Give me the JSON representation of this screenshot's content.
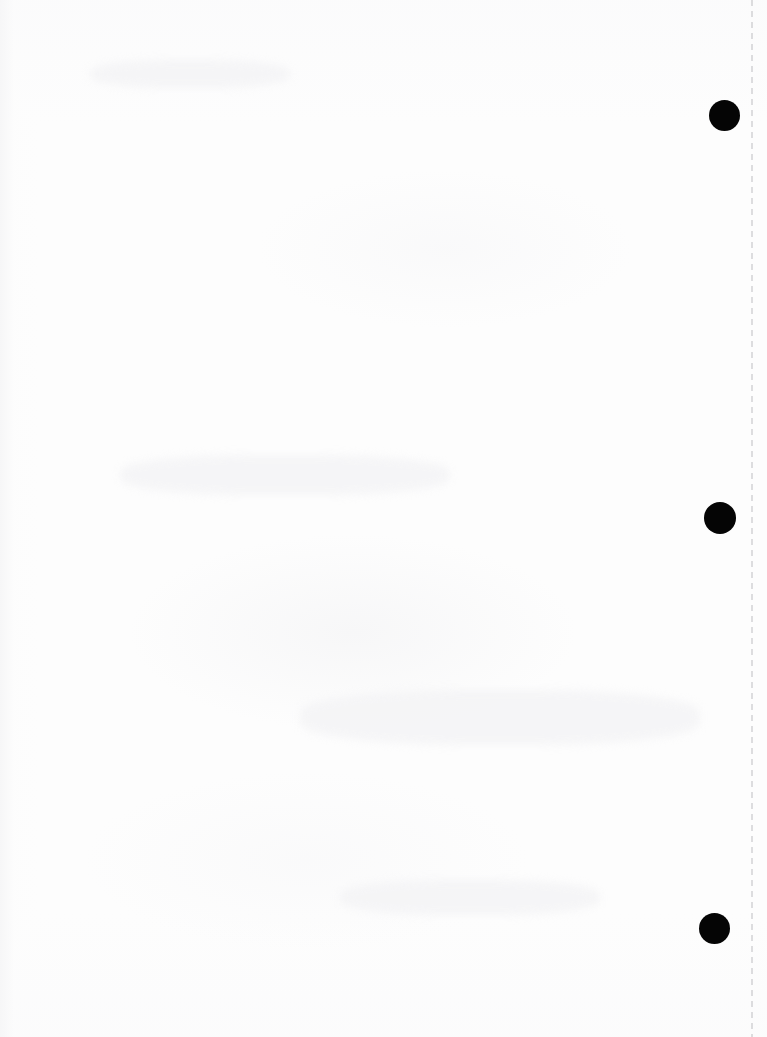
{
  "page": {
    "label": "Scanned blank page",
    "width": 767,
    "height": 1037,
    "background_color": "#fdfdfd",
    "content_text": ""
  },
  "margin_guide": {
    "name": "vertical-dashed-margin-line",
    "orientation": "vertical",
    "color": "#c9c9cc",
    "x": 751,
    "thickness": 2,
    "dash_length": 6,
    "gap_length": 5
  },
  "marks": {
    "color": "#050505",
    "count": 3,
    "shape": "circle",
    "dots": [
      {
        "name": "mark-dot-top",
        "x": 709,
        "y": 100,
        "size": 31
      },
      {
        "name": "mark-dot-middle",
        "x": 704,
        "y": 502,
        "size": 32
      },
      {
        "name": "mark-dot-bottom",
        "x": 699,
        "y": 913,
        "size": 31
      }
    ]
  },
  "artifacts": {
    "name": "scan-bleed-through",
    "color": "#f3f3f5",
    "spots": [
      {
        "x": 120,
        "y": 455,
        "w": 330,
        "h": 40
      },
      {
        "x": 300,
        "y": 690,
        "w": 400,
        "h": 55
      },
      {
        "x": 340,
        "y": 880,
        "w": 260,
        "h": 35
      },
      {
        "x": 90,
        "y": 60,
        "w": 200,
        "h": 28
      }
    ]
  }
}
